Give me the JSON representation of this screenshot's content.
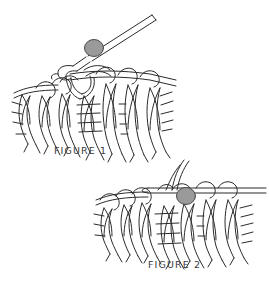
{
  "document": {
    "type": "line-art instructional illustration",
    "subject": "knitting stitches on needle with stitch marker",
    "background_color": "#ffffff",
    "ink_color": "#2b2b2b",
    "marker_color": "#9a9a9a",
    "marker_stroke_color": "#4a4a4a",
    "width": 269,
    "height": 284
  },
  "figures": [
    {
      "id": "figure-1",
      "caption": "FIGURE 1",
      "caption_position": {
        "x": 54,
        "y": 145
      },
      "description": "Knitted fabric on a needle angled up to the right, with a round stitch marker bead threaded on the needle shaft and a loop being drawn through.",
      "marker": {
        "shape": "round-bead",
        "cx": 94,
        "cy": 48,
        "rx": 9,
        "ry": 8,
        "on": "needle-shaft"
      },
      "needle": {
        "from": [
          86,
          56
        ],
        "to": [
          152,
          14
        ],
        "style": "double-line-straight"
      },
      "stitch_columns": 8,
      "marker_color": "#9a9a9a"
    },
    {
      "id": "figure-2",
      "caption": "FIGURE 2",
      "caption_position": {
        "x": 148,
        "y": 259
      },
      "description": "Knitted fabric on a horizontal needle with the stitch marker bead dropped down onto a stitch, two yarn strands rising from the needle.",
      "marker": {
        "shape": "round-bead",
        "cx": 186,
        "cy": 196,
        "rx": 9,
        "ry": 8,
        "on": "stitch"
      },
      "needle": {
        "from": [
          150,
          190
        ],
        "to": [
          266,
          190
        ],
        "style": "double-line-horizontal"
      },
      "stitch_columns": 7,
      "marker_color": "#9a9a9a"
    }
  ],
  "captions": {
    "figure_1_label": "FIGURE 1",
    "figure_2_label": "FIGURE 2"
  }
}
